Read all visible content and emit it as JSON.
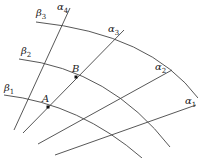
{
  "labels": {
    "alpha1": {
      "sym": "α",
      "sub": "1"
    },
    "alpha2": {
      "sym": "α",
      "sub": "2"
    },
    "alpha3": {
      "sym": "α",
      "sub": "3"
    },
    "alpha4": {
      "sym": "α",
      "sub": "4"
    },
    "beta1": {
      "sym": "β",
      "sub": "1"
    },
    "beta2": {
      "sym": "β",
      "sub": "2"
    },
    "beta3": {
      "sym": "β",
      "sub": "3"
    },
    "pointA": "A",
    "pointB": "B"
  },
  "colors": {
    "line": "#444444",
    "point": "#111111"
  }
}
